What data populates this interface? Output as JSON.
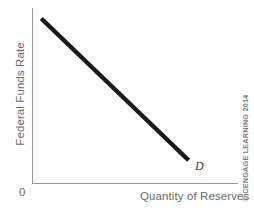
{
  "figure": {
    "background_color": "#ffffff",
    "width": 254,
    "height": 211
  },
  "axes": {
    "origin_label": "0",
    "axis_color": "#9a9a9a"
  },
  "labels": {
    "y_axis": "Federal Funds Rate",
    "x_axis": "Quantity of Reserves",
    "curve": "D",
    "copyright": "© CENGAGE LEARNING 2014"
  },
  "chart_data": {
    "type": "line",
    "title": "",
    "subtitle": "",
    "xlabel": "Quantity of Reserves",
    "ylabel": "Federal Funds Rate",
    "xlim": [
      0,
      100
    ],
    "ylim": [
      0,
      100
    ],
    "grid": false,
    "legend": "none",
    "axis_ticks": {
      "x": [],
      "y": [],
      "origin": "0"
    },
    "series": [
      {
        "name": "D",
        "label": "D",
        "description": "Downward-sloping demand curve for reserves",
        "color": "#1a1a1a",
        "line_width": 4.5,
        "x": [
          4.5,
          76
        ],
        "y": [
          94,
          13
        ]
      }
    ],
    "annotations": [
      {
        "text": "D",
        "x": 80,
        "y": 10,
        "style": "italic",
        "description": "Label identifying the demand curve at its lower-right endpoint"
      },
      {
        "text": "© CENGAGE LEARNING 2014",
        "position": "right-margin-vertical",
        "description": "Publisher copyright notice rotated along the right edge"
      }
    ]
  }
}
